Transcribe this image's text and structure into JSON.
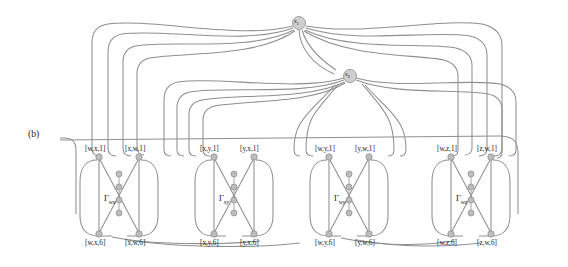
{
  "figure": {
    "panel_label": "(b)",
    "caption_label": "(b)",
    "background": "#ffffff",
    "line_color": "#8f8f8f",
    "node_fill": "#b9b9b9",
    "node_stroke": "#7a7a7a",
    "source_nodes": [
      {
        "id": "s1",
        "label": "s",
        "subscript": "1",
        "cx": 299,
        "cy": 23,
        "r": 6.5
      },
      {
        "id": "s2",
        "label": "s",
        "subscript": "2",
        "cx": 350,
        "cy": 76,
        "r": 6.5
      }
    ],
    "gadgets": [
      {
        "id": "wx",
        "gamma_label": "Γ",
        "gamma_sub": "wx",
        "top_left_label": "[w,x,1]",
        "top_right_label": "[x,w,1]",
        "bottom_left_label": "[w,x,6]",
        "bottom_right_label": "[x,w,6]",
        "x_left": 97,
        "x_right": 137,
        "y_top": 156,
        "y_bottom": 235
      },
      {
        "id": "xy",
        "gamma_label": "Γ",
        "gamma_sub": "xy",
        "top_left_label": "[x,y,1]",
        "top_right_label": "[y,x,1]",
        "bottom_left_label": "[x,y,6]",
        "bottom_right_label": "[y,x,6]",
        "x_left": 212,
        "x_right": 252,
        "y_top": 156,
        "y_bottom": 235
      },
      {
        "id": "wy",
        "gamma_label": "Γ",
        "gamma_sub": "wy",
        "top_left_label": "[w,y,1]",
        "top_right_label": "[y,w,1]",
        "bottom_left_label": "[w,y,6]",
        "bottom_right_label": "[y,w,6]",
        "x_left": 327,
        "x_right": 367,
        "y_top": 156,
        "y_bottom": 235
      },
      {
        "id": "wz",
        "gamma_label": "Γ",
        "gamma_sub": "wz",
        "top_left_label": "[w,z,1]",
        "top_right_label": "[z,w,1]",
        "bottom_left_label": "[w,z,6]",
        "bottom_right_label": "[z,w,6]",
        "x_left": 449,
        "x_right": 489,
        "y_top": 156,
        "y_bottom": 235
      }
    ],
    "internal_nodes_per_column": 4
  }
}
